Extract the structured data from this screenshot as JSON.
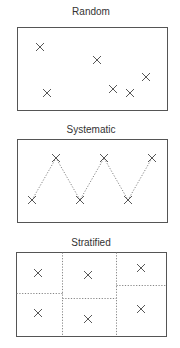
{
  "colors": {
    "frame": "#555555",
    "mark": "#444444",
    "text": "#333333",
    "dotted": "#777777"
  },
  "panels": [
    {
      "title": "Random",
      "title_pos": [
        91,
        15
      ],
      "frame": [
        17,
        27,
        150,
        83
      ],
      "marks": [
        [
          40,
          47
        ],
        [
          97,
          60
        ],
        [
          47,
          93
        ],
        [
          113,
          89
        ],
        [
          130,
          93
        ],
        [
          146,
          77
        ]
      ],
      "path": [],
      "dividers": []
    },
    {
      "title": "Systematic",
      "title_pos": [
        91,
        133
      ],
      "frame": [
        17,
        139,
        150,
        83
      ],
      "marks": [
        [
          32,
          200
        ],
        [
          56,
          158
        ],
        [
          80,
          200
        ],
        [
          104,
          158
        ],
        [
          128,
          200
        ],
        [
          152,
          158
        ]
      ],
      "path": [
        [
          32,
          200
        ],
        [
          56,
          158
        ],
        [
          80,
          200
        ],
        [
          104,
          158
        ],
        [
          128,
          200
        ],
        [
          152,
          158
        ]
      ],
      "dividers": []
    },
    {
      "title": "Stratified",
      "title_pos": [
        91,
        246
      ],
      "frame": [
        16,
        252,
        150,
        84
      ],
      "marks": [
        [
          38,
          273
        ],
        [
          88,
          275
        ],
        [
          141,
          268
        ],
        [
          38,
          313
        ],
        [
          88,
          319
        ],
        [
          141,
          309
        ]
      ],
      "path": [],
      "dividers": [
        [
          [
            62,
            252
          ],
          [
            62,
            336
          ]
        ],
        [
          [
            116,
            252
          ],
          [
            116,
            336
          ]
        ],
        [
          [
            16,
            293
          ],
          [
            62,
            293
          ]
        ],
        [
          [
            62,
            298
          ],
          [
            116,
            298
          ]
        ],
        [
          [
            116,
            285
          ],
          [
            166,
            285
          ]
        ]
      ]
    }
  ]
}
